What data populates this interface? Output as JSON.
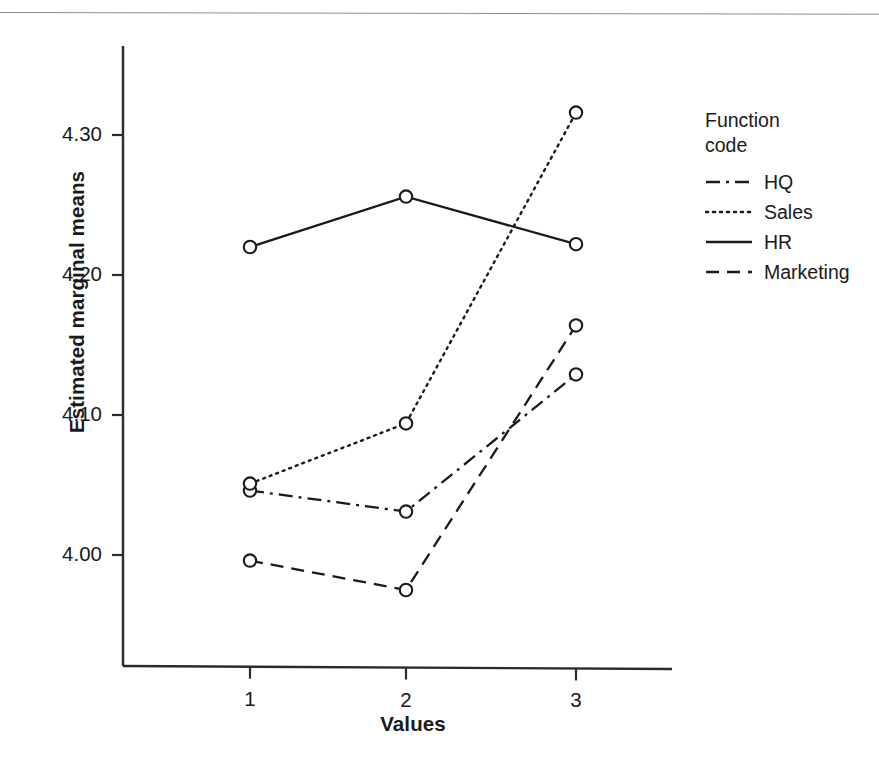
{
  "chart_data": {
    "type": "line",
    "title": "",
    "xlabel": "Values",
    "ylabel": "Estimated marginal means",
    "x": [
      1,
      2,
      3
    ],
    "xtick_labels": [
      "1",
      "2",
      "3"
    ],
    "ytick_labels": [
      "4.00",
      "4.10",
      "4.20",
      "4.30"
    ],
    "ytick_values": [
      4.0,
      4.1,
      4.2,
      4.3
    ],
    "ylim": [
      3.93,
      4.345
    ],
    "xlim": [
      0.55,
      3.45
    ],
    "grid": false,
    "legend_position": "right",
    "legend_title": "Function\ncode",
    "marker": "open-circle",
    "series": [
      {
        "name": "HQ",
        "linestyle": "dashdot",
        "dasharray": "14,6,3,6",
        "values": [
          4.046,
          4.031,
          4.129
        ]
      },
      {
        "name": "Sales",
        "linestyle": "dotted",
        "dasharray": "2,5",
        "values": [
          4.051,
          4.094,
          4.316
        ]
      },
      {
        "name": "HR",
        "linestyle": "solid",
        "dasharray": "",
        "values": [
          4.22,
          4.256,
          4.222
        ]
      },
      {
        "name": "Marketing",
        "linestyle": "dashed",
        "dasharray": "13,8",
        "values": [
          3.996,
          3.975,
          4.164
        ]
      }
    ]
  },
  "colors": {
    "ink": "#1a1a1a",
    "axis": "#2b2b2b",
    "rule": "#8d8f92",
    "background": "#ffffff"
  }
}
